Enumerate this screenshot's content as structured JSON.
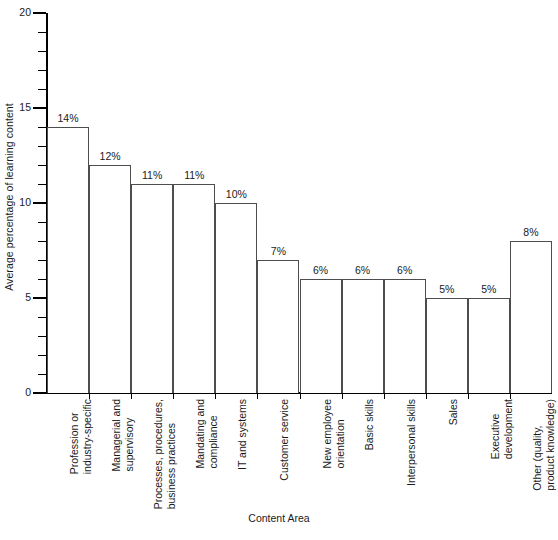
{
  "chart_data": {
    "type": "bar",
    "title": "",
    "xlabel": "Content Area",
    "ylabel": "Average percentage of learning content",
    "ylim": [
      0,
      20
    ],
    "ytick_major": [
      0,
      5,
      10,
      15,
      20
    ],
    "ytick_minor_step": 1,
    "grid": false,
    "legend": null,
    "categories": [
      "Profession or industry-specific",
      "Managerial and supervisory",
      "Processes, procedures, business practices",
      "Mandating and compliance",
      "IT and systems",
      "Customer service",
      "New employee orientation",
      "Basic skills",
      "Interpersonal skills",
      "Sales",
      "Executive development",
      "Other (quality, product knowledge)"
    ],
    "category_lines": [
      [
        "Profession or",
        "industry-specific"
      ],
      [
        "Managerial and",
        "supervisory"
      ],
      [
        "Processes, procedures,",
        "business practices"
      ],
      [
        "Mandating and",
        "compliance"
      ],
      [
        "IT and systems"
      ],
      [
        "Customer service"
      ],
      [
        "New employee",
        "orientation"
      ],
      [
        "Basic skills"
      ],
      [
        "Interpersonal skills"
      ],
      [
        "Sales"
      ],
      [
        "Executive",
        "development"
      ],
      [
        "Other (quality,",
        "product knowledge)"
      ]
    ],
    "values": [
      14,
      12,
      11,
      11,
      10,
      7,
      6,
      6,
      6,
      5,
      5,
      8
    ],
    "value_labels": [
      "14%",
      "12%",
      "11%",
      "11%",
      "10%",
      "7%",
      "6%",
      "6%",
      "6%",
      "5%",
      "5%",
      "8%"
    ],
    "bar_fill_color": "#ffffff",
    "bar_edge_color": "#4d4d4d",
    "axis_color": "#000000",
    "text_color": "#1a1a1a",
    "background_color": "#ffffff"
  }
}
